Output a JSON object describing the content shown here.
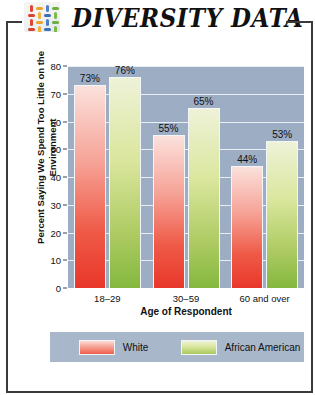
{
  "header": {
    "title": "DIVERSITY DATA",
    "logo_icon": "colored-dashes-grid-icon"
  },
  "chart_data": {
    "type": "bar",
    "title": "DIVERSITY DATA",
    "xlabel": "Age of Respondent",
    "ylabel": "Percent Saying We Spend Too Little on the Environment",
    "categories": [
      "18–29",
      "30–59",
      "60 and over"
    ],
    "series": [
      {
        "name": "White",
        "color": "#ef5a47",
        "values": [
          73,
          55,
          44
        ],
        "labels": [
          "73%",
          "55%",
          "44%"
        ]
      },
      {
        "name": "African American",
        "color": "#a9c85e",
        "values": [
          76,
          65,
          53
        ],
        "labels": [
          "76%",
          "65%",
          "53%"
        ]
      }
    ],
    "ylim": [
      0,
      80
    ],
    "ytick_labels": [
      "0",
      "10",
      "20",
      "30",
      "40",
      "50",
      "60",
      "70",
      "80"
    ],
    "ytick_values": [
      0,
      10,
      20,
      30,
      40,
      50,
      60,
      70,
      80
    ],
    "grid": true,
    "legend_position": "bottom",
    "plot_background": "#9dadc3",
    "gridline_color": "#e8eef4"
  }
}
